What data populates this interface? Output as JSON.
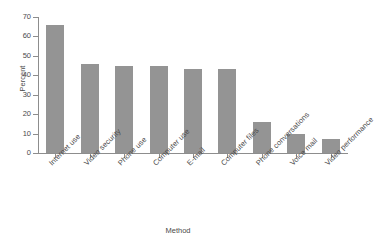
{
  "chart_data": {
    "type": "bar",
    "title": "",
    "xlabel": "Method",
    "ylabel": "Percent",
    "ylim": [
      0,
      70
    ],
    "yticks": [
      0,
      10,
      20,
      30,
      40,
      50,
      60,
      70
    ],
    "grid": false,
    "legend": "none",
    "bar_color": "#949494",
    "axis_color": "#8d8d8d",
    "categories": [
      "Internet use",
      "Video security",
      "Phone use",
      "Computer use",
      "E-mail",
      "Computer files",
      "Phone conversations",
      "Voice mail",
      "Video performance"
    ],
    "values": [
      66,
      46,
      45,
      45,
      43,
      43,
      16,
      10,
      7
    ]
  }
}
